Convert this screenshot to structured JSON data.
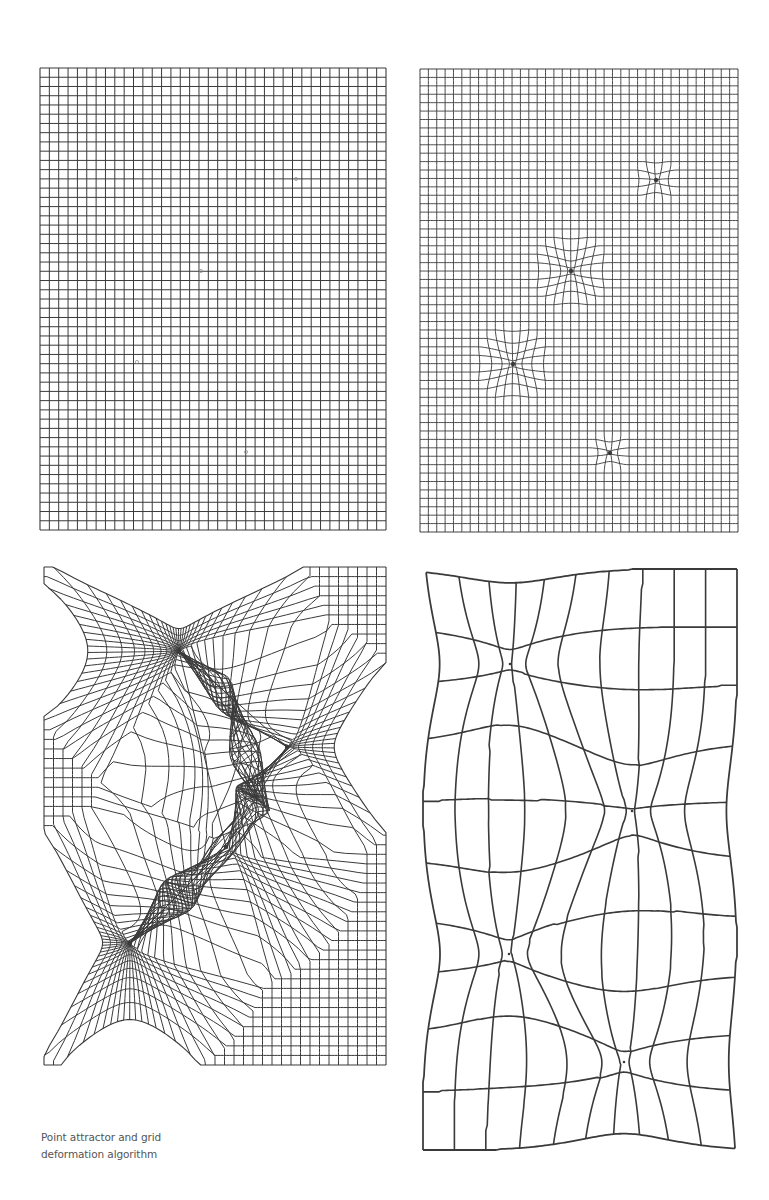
{
  "figure": {
    "caption": {
      "line1": "Point attractor and grid",
      "line2": "deformation algorithm"
    },
    "line_color": "#3a3a3a",
    "background": "#ffffff"
  },
  "panels": [
    {
      "id": "panel-1",
      "description": "Regular undeformed grid with faint attractor point markers",
      "box": {
        "x": 40,
        "y": 68,
        "w": 346,
        "h": 462
      },
      "cols": 37,
      "rows": 50,
      "stroke_width": 1.0,
      "mode": "regular",
      "markers": [
        [
          296,
          179
        ],
        [
          201,
          271
        ],
        [
          137,
          362
        ],
        [
          246,
          452
        ]
      ]
    },
    {
      "id": "panel-2",
      "description": "Dense grid with four small radial point attractors",
      "box": {
        "x": 420,
        "y": 69,
        "w": 318,
        "h": 463
      },
      "cols": 38,
      "rows": 55,
      "stroke_width": 0.9,
      "mode": "radial",
      "attractors": [
        {
          "x": 656,
          "y": 180,
          "radius": 22,
          "strength": 1.0
        },
        {
          "x": 571,
          "y": 271,
          "radius": 38,
          "strength": 1.0
        },
        {
          "x": 513,
          "y": 364,
          "radius": 38,
          "strength": 1.0
        },
        {
          "x": 610,
          "y": 453,
          "radius": 20,
          "strength": 1.0
        }
      ]
    },
    {
      "id": "panel-3",
      "description": "Grid strongly pulled into four attractors forming fan bundles and a triangulated void",
      "box": {
        "x": 44,
        "y": 567,
        "w": 342,
        "h": 498
      },
      "cols": 36,
      "rows": 52,
      "stroke_width": 1.0,
      "mode": "strong",
      "attractors": [
        {
          "x": 179,
          "y": 651,
          "radius": 150
        },
        {
          "x": 287,
          "y": 747,
          "radius": 130
        },
        {
          "x": 226,
          "y": 847,
          "radius": 140
        },
        {
          "x": 130,
          "y": 943,
          "radius": 140
        }
      ],
      "links": [
        [
          0,
          1
        ],
        [
          0,
          2
        ],
        [
          1,
          2
        ],
        [
          2,
          3
        ]
      ]
    },
    {
      "id": "panel-4",
      "description": "Coarse grid pinched by four attractors",
      "box": {
        "x": 423,
        "y": 569,
        "w": 314,
        "h": 581
      },
      "cols": 10,
      "rows": 10,
      "stroke_width": 1.6,
      "mode": "pinch",
      "attractors": [
        {
          "x": 510,
          "y": 664,
          "radius": 70
        },
        {
          "x": 632,
          "y": 811,
          "radius": 70
        },
        {
          "x": 509,
          "y": 954,
          "radius": 70
        },
        {
          "x": 624,
          "y": 1062,
          "radius": 70
        }
      ]
    }
  ]
}
